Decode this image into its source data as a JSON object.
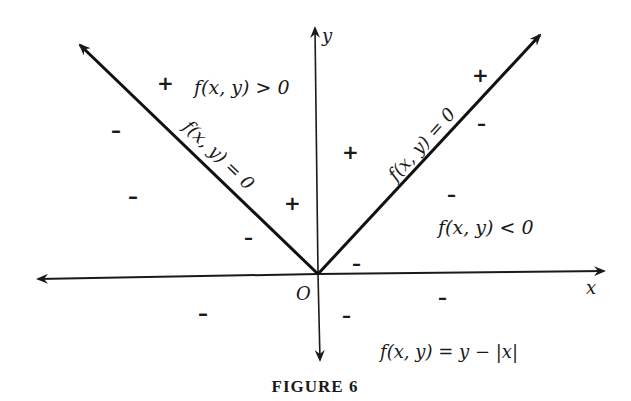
{
  "figure": {
    "caption": "FIGURE 6",
    "function_label": "f(x, y) = y − |x|",
    "axes": {
      "x_label": "x",
      "y_label": "y",
      "origin_label": "O"
    },
    "boundary_labels": {
      "left_arm": "f(x, y) = 0",
      "right_arm": "f(x, y) = 0"
    },
    "region_labels": {
      "positive": "f(x, y) > 0",
      "negative": "f(x, y) < 0"
    },
    "signs": {
      "plus": "+",
      "minus": "–"
    },
    "colors": {
      "ink": "#1a1a1a",
      "background": "#ffffff"
    }
  }
}
